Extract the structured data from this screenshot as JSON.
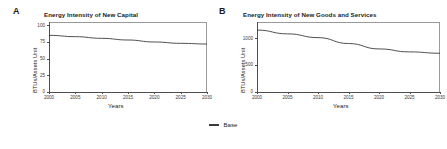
{
  "figure": {
    "background": "#ffffff",
    "line_color": "#3c3c3c",
    "axis_color": "#4d4d4d"
  },
  "legend": {
    "position": "bottom-center",
    "entries": [
      {
        "label": "Base",
        "color": "#3c3c3c",
        "swatch": "line-swatch"
      }
    ]
  },
  "panels": [
    {
      "letter": "A",
      "title": "Energy Intensity of New Capital",
      "xlabel": "Years",
      "ylabel": "BTUs/Assets Unit"
    },
    {
      "letter": "B",
      "title": "Energy Intensity of New Goods and Services",
      "xlabel": "Years",
      "ylabel": "BTUs/Assets Unit"
    }
  ],
  "chart_data": [
    {
      "type": "line",
      "panel": "A",
      "title": "Energy Intensity of New Capital",
      "xlabel": "Years",
      "ylabel": "BTUs/Assets Unit",
      "xlim": [
        2000,
        2030
      ],
      "ylim": [
        0,
        105
      ],
      "xticks": [
        2000,
        2005,
        2010,
        2015,
        2020,
        2025,
        2030
      ],
      "yticks": [
        0,
        25,
        50,
        75,
        100
      ],
      "grid": false,
      "legend_position": "bottom-center",
      "series": [
        {
          "name": "Base",
          "color": "#3c3c3c",
          "x": [
            2000,
            2005,
            2010,
            2015,
            2020,
            2025,
            2030
          ],
          "values": [
            85,
            83,
            80.5,
            78,
            75,
            73,
            72
          ]
        }
      ]
    },
    {
      "type": "line",
      "panel": "B",
      "title": "Energy Intensity of New Goods and Services",
      "xlabel": "Years",
      "ylabel": "BTUs/Assets Unit",
      "xlim": [
        2000,
        2030
      ],
      "ylim": [
        0,
        1300
      ],
      "xticks": [
        2000,
        2005,
        2010,
        2015,
        2020,
        2025,
        2030
      ],
      "yticks": [
        0,
        500,
        1000
      ],
      "grid": false,
      "legend_position": "bottom-center",
      "series": [
        {
          "name": "Base",
          "color": "#3c3c3c",
          "x": [
            2000,
            2005,
            2010,
            2015,
            2020,
            2025,
            2030
          ],
          "values": [
            1150,
            1080,
            1010,
            900,
            800,
            745,
            720
          ]
        }
      ]
    }
  ]
}
